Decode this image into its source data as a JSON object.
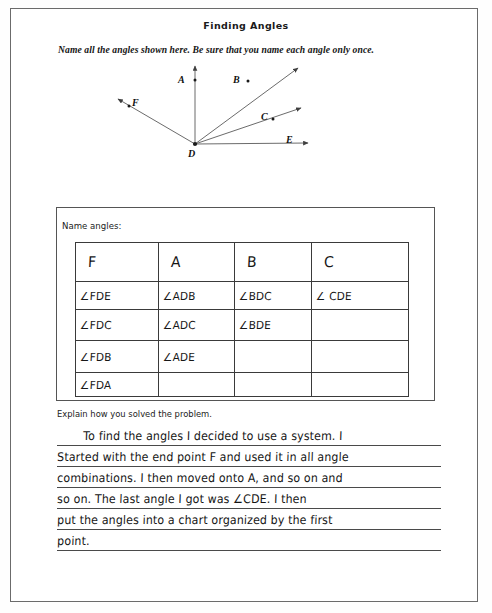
{
  "header": {
    "title": "Finding Angles",
    "instruction": "Name all the angles shown here. Be sure that you name each angle only once."
  },
  "diagram": {
    "name": "angle-diagram",
    "vertex_label": "D",
    "ray_labels": [
      "A",
      "B",
      "C",
      "E",
      "F"
    ],
    "labels": {
      "A": "A",
      "B": "B",
      "C": "C",
      "D": "D",
      "E": "E",
      "F": "F"
    },
    "vertex_point": [
      95,
      86
    ],
    "rays": [
      {
        "label": "A",
        "tip": [
          95,
          6
        ]
      },
      {
        "label": "B",
        "tip": [
          200,
          8
        ]
      },
      {
        "label": "C",
        "tip": [
          203,
          49
        ]
      },
      {
        "label": "E",
        "tip": [
          210,
          85
        ]
      },
      {
        "label": "F",
        "tip": [
          16,
          40
        ]
      }
    ],
    "line_color": "#4a4a4a"
  },
  "table_section": {
    "label": "Name angles:",
    "columns": [
      "F",
      "A",
      "B",
      "C"
    ],
    "rows": [
      [
        "∠FDE",
        "∠ADB",
        "∠BDC",
        "∠ CDE"
      ],
      [
        "∠FDC",
        "∠ADC",
        "∠BDE",
        ""
      ],
      [
        "∠FDB",
        "∠ADE",
        "",
        ""
      ],
      [
        "∠FDA",
        "",
        "",
        ""
      ]
    ]
  },
  "explanation": {
    "prompt": "Explain how you solved the problem.",
    "lines": [
      "To find the angles I decided to use a system. I",
      "Started with the end point F and used it in all angle",
      "combinations. I then moved onto A, and so on and",
      "so on. The last angle I got was ∠CDE. I then",
      "put the angles into a chart organized by the first",
      "point."
    ]
  }
}
